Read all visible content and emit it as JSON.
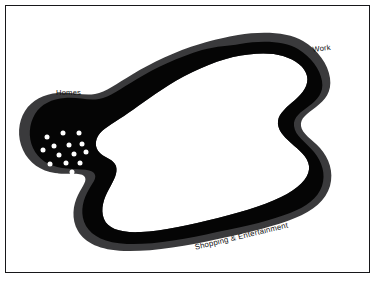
{
  "figure": {
    "frame": {
      "border_color": "#17171a",
      "background_color": "#ffffff"
    },
    "shape": {
      "outer_band_color": "#3a3a3c",
      "interior_color": "#050505",
      "hole_color": "#ffffff",
      "dot_color": "#ffffff"
    }
  },
  "labels": {
    "homes": "Homes",
    "work": "Work",
    "shopping": "Shopping & Entertainment"
  },
  "chart_data": {
    "type": "scatter",
    "xlabel": "",
    "ylabel": "",
    "xlim": [
      0,
      377
    ],
    "ylim": [
      0,
      286
    ],
    "grid": false,
    "legend_position": "none",
    "annotations": [
      {
        "text": "Homes",
        "x": 56,
        "y": 93
      },
      {
        "text": "Work",
        "x": 312,
        "y": 50
      },
      {
        "text": "Shopping & Entertainment",
        "x": 194,
        "y": 248
      }
    ],
    "series": [
      {
        "name": "Homes",
        "color": "#ffffff",
        "count": 15,
        "points": [
          [
            47,
            137
          ],
          [
            63,
            133
          ],
          [
            79,
            133
          ],
          [
            54,
            146
          ],
          [
            69,
            145
          ],
          [
            82,
            144
          ],
          [
            43,
            150
          ],
          [
            59,
            155
          ],
          [
            74,
            154
          ],
          [
            86,
            152
          ],
          [
            50,
            164
          ],
          [
            66,
            163
          ],
          [
            80,
            163
          ],
          [
            57,
            176
          ],
          [
            72,
            172
          ]
        ]
      },
      {
        "name": "Work",
        "color": "#ffffff",
        "count": 8,
        "points": [
          [
            262,
            70
          ],
          [
            275,
            67
          ],
          [
            286,
            70
          ],
          [
            251,
            79
          ],
          [
            271,
            78
          ],
          [
            284,
            81
          ],
          [
            265,
            90
          ],
          [
            268,
            60
          ]
        ]
      },
      {
        "name": "Shopping & Entertainment",
        "color": "#ffffff",
        "count": 48,
        "points": [
          [
            255,
            150
          ],
          [
            242,
            156
          ],
          [
            265,
            160
          ],
          [
            279,
            155
          ],
          [
            228,
            163
          ],
          [
            251,
            166
          ],
          [
            240,
            170
          ],
          [
            271,
            165
          ],
          [
            219,
            168
          ],
          [
            262,
            172
          ],
          [
            285,
            166
          ],
          [
            297,
            162
          ],
          [
            206,
            174
          ],
          [
            233,
            176
          ],
          [
            247,
            178
          ],
          [
            276,
            173
          ],
          [
            196,
            180
          ],
          [
            214,
            182
          ],
          [
            256,
            182
          ],
          [
            290,
            177
          ],
          [
            184,
            184
          ],
          [
            222,
            186
          ],
          [
            265,
            188
          ],
          [
            240,
            186
          ],
          [
            175,
            188
          ],
          [
            202,
            190
          ],
          [
            231,
            192
          ],
          [
            253,
            195
          ],
          [
            190,
            194
          ],
          [
            211,
            196
          ],
          [
            244,
            198
          ],
          [
            274,
            192
          ],
          [
            162,
            194
          ],
          [
            178,
            198
          ],
          [
            198,
            200
          ],
          [
            220,
            201
          ],
          [
            132,
            198
          ],
          [
            147,
            197
          ],
          [
            157,
            202
          ],
          [
            168,
            206
          ],
          [
            126,
            206
          ],
          [
            139,
            205
          ],
          [
            152,
            210
          ],
          [
            164,
            213
          ],
          [
            133,
            213
          ],
          [
            145,
            214
          ],
          [
            157,
            219
          ],
          [
            170,
            218
          ]
        ]
      }
    ]
  }
}
